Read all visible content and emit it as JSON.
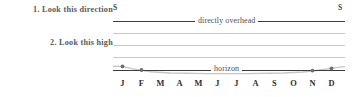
{
  "instructions": [
    {
      "id": "look-direction",
      "text": "1. Look this direction"
    },
    {
      "id": "look-high",
      "text": "2. Look this high"
    }
  ],
  "directions": {
    "left_label": "S",
    "right_label": "S"
  },
  "band_labels": {
    "overhead": "directly overhead",
    "horizon": "horizon"
  },
  "colors": {
    "heavy_rule": "#3d3d3d",
    "grid_rule": "#c9c9c9",
    "curve": "#b9b9b9",
    "marker": "#6f6f6f",
    "label_text": "#5a5a5a",
    "axis_text": "#2e2e2e",
    "background": "#ffffff"
  },
  "chart_data": {
    "type": "line",
    "title": "",
    "subtitle": "",
    "xlabel": "",
    "ylabel": "",
    "grid": true,
    "legend": null,
    "categories": [
      "J",
      "F",
      "M",
      "A",
      "M",
      "J",
      "J",
      "A",
      "S",
      "O",
      "N",
      "D"
    ],
    "x_tick_labels": [
      "J",
      "F",
      "M",
      "A",
      "M",
      "J",
      "J",
      "A",
      "S",
      "O",
      "N",
      "D"
    ],
    "y_axis": {
      "top_label": "directly overhead",
      "bottom_label": "horizon",
      "ylim": [
        0,
        4
      ],
      "gridline_values": [
        1,
        2,
        3
      ],
      "heavy_rule_values": [
        0,
        4
      ]
    },
    "annotations": [
      {
        "text": "S",
        "position": "top-left",
        "meaning": "compass-direction"
      },
      {
        "text": "S",
        "position": "top-right",
        "meaning": "compass-direction"
      },
      {
        "text": "directly overhead",
        "position": "top-band"
      },
      {
        "text": "horizon",
        "position": "bottom-band"
      }
    ],
    "series": [
      {
        "name": "altitude",
        "values": [
          0.38,
          0.14,
          null,
          null,
          null,
          null,
          null,
          null,
          null,
          null,
          0.08,
          0.3
        ],
        "visible_markers": [
          "J",
          "F",
          "N",
          "D"
        ],
        "note": "curve dips below the horizon rule from M through O; only the four end months are plotted above it"
      }
    ]
  }
}
